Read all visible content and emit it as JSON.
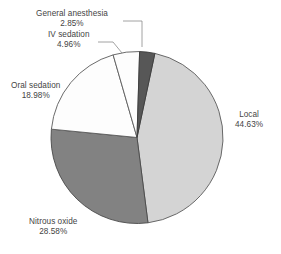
{
  "chart_data": {
    "type": "pie",
    "title": "",
    "subtitle": "",
    "xlabel": "",
    "ylabel": "",
    "legend_position": "none",
    "grid": false,
    "units": "percent",
    "total": 100,
    "start_angle_deg": 12,
    "direction": "clockwise",
    "categories": [
      "Local",
      "Nitrous oxide",
      "Oral sedation",
      "IV sedation",
      "General anesthesia"
    ],
    "values": [
      44.63,
      28.58,
      18.98,
      4.96,
      2.85
    ],
    "slices": [
      {
        "label": "Local",
        "value": 44.63,
        "value_text": "44.63%",
        "color": "#d4d4d4",
        "stroke": "#5a5a5a"
      },
      {
        "label": "Nitrous oxide",
        "value": 28.58,
        "value_text": "28.58%",
        "color": "#828282",
        "stroke": "#4a4a4a"
      },
      {
        "label": "Oral sedation",
        "value": 18.98,
        "value_text": "18.98%",
        "color": "#fdfdfd",
        "stroke": "#5a5a5a"
      },
      {
        "label": "IV sedation",
        "value": 4.96,
        "value_text": "4.96%",
        "color": "#fdfdfd",
        "stroke": "#5a5a5a"
      },
      {
        "label": "General anesthesia",
        "value": 2.85,
        "value_text": "2.85%",
        "color": "#575757",
        "stroke": "#3c3c3c"
      }
    ],
    "leader_line_color": "#8a8a8a",
    "label_text_color": "#444444"
  }
}
